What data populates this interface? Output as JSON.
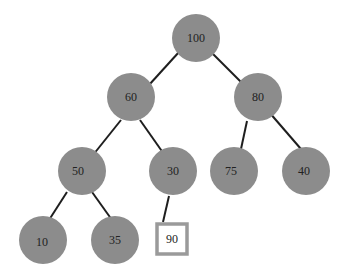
{
  "diagram": {
    "type": "binary-tree",
    "node_color": "#8c8c8c",
    "edge_color": "#1e1e1e",
    "highlight_border_color": "#9a9a9a",
    "nodes": [
      {
        "id": "n100",
        "label": "100",
        "x": 196,
        "y": 38,
        "shape": "circle"
      },
      {
        "id": "n60",
        "label": "60",
        "x": 131,
        "y": 97,
        "shape": "circle"
      },
      {
        "id": "n80",
        "label": "80",
        "x": 258,
        "y": 97,
        "shape": "circle"
      },
      {
        "id": "n50",
        "label": "50",
        "x": 82,
        "y": 171,
        "shape": "circle"
      },
      {
        "id": "n30",
        "label": "30",
        "x": 173,
        "y": 171,
        "shape": "circle"
      },
      {
        "id": "n75",
        "label": "75",
        "x": 234,
        "y": 171,
        "shape": "circle"
      },
      {
        "id": "n40",
        "label": "40",
        "x": 306,
        "y": 171,
        "shape": "circle"
      },
      {
        "id": "n10",
        "label": "10",
        "x": 43,
        "y": 240,
        "shape": "circle"
      },
      {
        "id": "n35",
        "label": "35",
        "x": 115,
        "y": 240,
        "shape": "circle"
      },
      {
        "id": "n90",
        "label": "90",
        "x": 172,
        "y": 240,
        "shape": "square"
      }
    ],
    "edges": [
      {
        "from": "n100",
        "to": "n60"
      },
      {
        "from": "n100",
        "to": "n80"
      },
      {
        "from": "n60",
        "to": "n50"
      },
      {
        "from": "n60",
        "to": "n30"
      },
      {
        "from": "n80",
        "to": "n75"
      },
      {
        "from": "n80",
        "to": "n40"
      },
      {
        "from": "n50",
        "to": "n10"
      },
      {
        "from": "n50",
        "to": "n35"
      },
      {
        "from": "n30",
        "to": "n90"
      }
    ]
  }
}
